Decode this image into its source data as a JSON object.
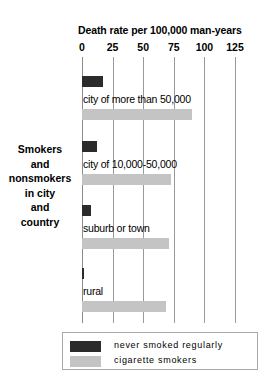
{
  "side_caption_lines": [
    "Smokers",
    "and",
    "nonsmokers",
    "in city",
    "and",
    "country"
  ],
  "legend": {
    "items": [
      {
        "label": "never smoked regularly",
        "color": "#2b2b2b",
        "key": "never_smoked"
      },
      {
        "label": "cigarette smokers",
        "color": "#c4c4c4",
        "key": "cigarette_smokers"
      }
    ]
  },
  "chart_data": {
    "type": "bar",
    "orientation": "horizontal",
    "title": "Death rate per 100,000 man-years",
    "xlabel": "Death rate per 100,000 man-years",
    "ylabel": "",
    "xlim": [
      0,
      125
    ],
    "xticks": [
      0,
      25,
      50,
      75,
      100,
      125
    ],
    "xtick_labels": [
      "0",
      "25",
      "50",
      "75",
      "100",
      "125"
    ],
    "grid": true,
    "grid_axis": "x",
    "legend_position": "bottom",
    "categories": [
      "city of more than 50,000",
      "city of 10,000-50,000",
      "suburb or town",
      "rural"
    ],
    "series": [
      {
        "name": "never smoked regularly",
        "color": "#2b2b2b",
        "values": [
          17,
          12,
          7,
          2
        ]
      },
      {
        "name": "cigarette smokers",
        "color": "#c4c4c4",
        "values": [
          90,
          73,
          71,
          69
        ]
      }
    ]
  }
}
